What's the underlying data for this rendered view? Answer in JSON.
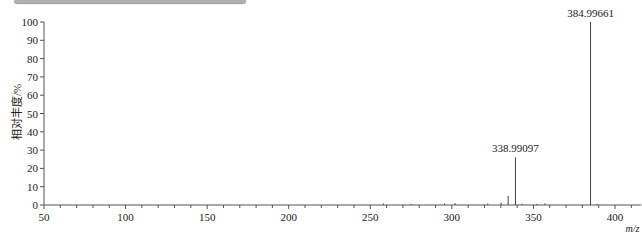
{
  "chart_data": {
    "type": "bar",
    "subtype": "mass-spectrum-stick",
    "title": "",
    "xlabel": "m/z",
    "ylabel": "相对丰度/%",
    "xlim": [
      50,
      410
    ],
    "ylim": [
      0,
      100
    ],
    "x_ticks": [
      50,
      100,
      150,
      200,
      250,
      300,
      350,
      400
    ],
    "y_ticks": [
      0,
      10,
      20,
      30,
      40,
      50,
      60,
      70,
      80,
      90,
      100
    ],
    "grid": false,
    "legend": null,
    "peaks": [
      {
        "mz": 384.99661,
        "intensity": 100,
        "label": "384.99661"
      },
      {
        "mz": 338.99097,
        "intensity": 26,
        "label": "338.99097"
      },
      {
        "mz": 334.5,
        "intensity": 5,
        "label": ""
      },
      {
        "mz": 330.2,
        "intensity": 1.2,
        "label": ""
      },
      {
        "mz": 322.0,
        "intensity": 0.8,
        "label": ""
      },
      {
        "mz": 302.0,
        "intensity": 1.0,
        "label": ""
      },
      {
        "mz": 295.5,
        "intensity": 0.8,
        "label": ""
      },
      {
        "mz": 275.0,
        "intensity": 0.6,
        "label": ""
      },
      {
        "mz": 258.0,
        "intensity": 0.8,
        "label": ""
      },
      {
        "mz": 343.0,
        "intensity": 0.7,
        "label": ""
      },
      {
        "mz": 352.0,
        "intensity": 0.6,
        "label": ""
      },
      {
        "mz": 357.0,
        "intensity": 0.8,
        "label": ""
      },
      {
        "mz": 389.0,
        "intensity": 0.6,
        "label": ""
      }
    ]
  },
  "axes": {
    "ylabel": "相对丰度/%",
    "xlabel": "m/z"
  }
}
